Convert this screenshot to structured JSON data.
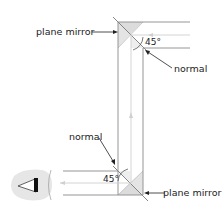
{
  "diagram": {
    "labels": {
      "top_mirror": "plane mirror",
      "bottom_mirror": "plane mirror",
      "top_normal": "normal",
      "bottom_normal": "normal",
      "top_angle": "45°",
      "bottom_angle": "45°"
    },
    "colors": {
      "line": "#8a8a8a",
      "ray": "#cfcfcf",
      "mirror_shade": "#d9d9d9",
      "eye_blob": "#e6e6e6",
      "text": "#222222"
    }
  }
}
